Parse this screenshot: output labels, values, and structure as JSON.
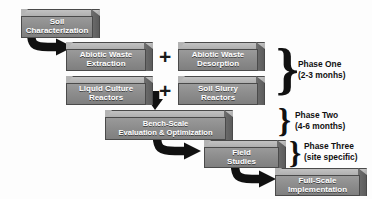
{
  "diagram": {
    "box_fill": "#8d8d8d",
    "box_top": "#b4b4b4",
    "box_side": "#5c5c5c",
    "box_text_color": "#ffffff",
    "arrow_color": "#111111",
    "background": "#fdfdfd"
  },
  "boxes": [
    {
      "id": "soil-characterization",
      "line1": "Soil",
      "line2": "Characterization"
    },
    {
      "id": "abiotic-waste-extraction",
      "line1": "Abiotic Waste",
      "line2": "Extraction"
    },
    {
      "id": "abiotic-waste-desorption",
      "line1": "Abiotic Waste",
      "line2": "Desorption"
    },
    {
      "id": "liquid-culture-reactors",
      "line1": "Liquid Culture",
      "line2": "Reactors"
    },
    {
      "id": "soil-slurry-reactors",
      "line1": "Soil Slurry",
      "line2": "Reactors"
    },
    {
      "id": "bench-scale-evaluation",
      "line1": "Bench-Scale",
      "line2": "Evaluation & Optimization"
    },
    {
      "id": "field-studies",
      "line1": "Field",
      "line2": "Studies"
    },
    {
      "id": "full-scale-implementation",
      "line1": "Full-Scale",
      "line2": "Implementation"
    }
  ],
  "operators": {
    "plus_top": "+",
    "plus_bottom": "+"
  },
  "phases": [
    {
      "id": "phase-one",
      "brace": "}",
      "name": "Phase One",
      "duration": "(2-3 monhs)"
    },
    {
      "id": "phase-two",
      "brace": "}",
      "name": "Phase Two",
      "duration": "(4-6 months)"
    },
    {
      "id": "phase-three",
      "brace": "}",
      "name": "Phase Three",
      "duration": "(site specific)"
    }
  ]
}
